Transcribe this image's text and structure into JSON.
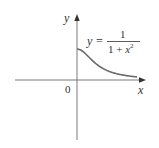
{
  "chart_data": {
    "type": "line",
    "title": "",
    "function": "y = 1/(1 + x^2)",
    "xlabel": "x",
    "ylabel": "y",
    "origin_label": "0",
    "annotation": {
      "lhs": "y =",
      "numerator": "1",
      "denominator_base": "1 + x",
      "denominator_exp": "2"
    },
    "domain": [
      0,
      3
    ],
    "x": [
      0,
      0.25,
      0.5,
      0.75,
      1,
      1.25,
      1.5,
      1.75,
      2,
      2.25,
      2.5,
      2.75,
      3
    ],
    "y": [
      1,
      0.941,
      0.8,
      0.64,
      0.5,
      0.39,
      0.308,
      0.246,
      0.2,
      0.165,
      0.138,
      0.117,
      0.1
    ],
    "grid": false,
    "legend": null,
    "colors": {
      "curve": "#6a6a6a",
      "axes": "#7a7a7a",
      "text": "#333333"
    }
  },
  "layout": {
    "origin_px": [
      77,
      80
    ],
    "x_scale_px_per_unit": 20,
    "y_scale_px_per_unit": 31
  }
}
